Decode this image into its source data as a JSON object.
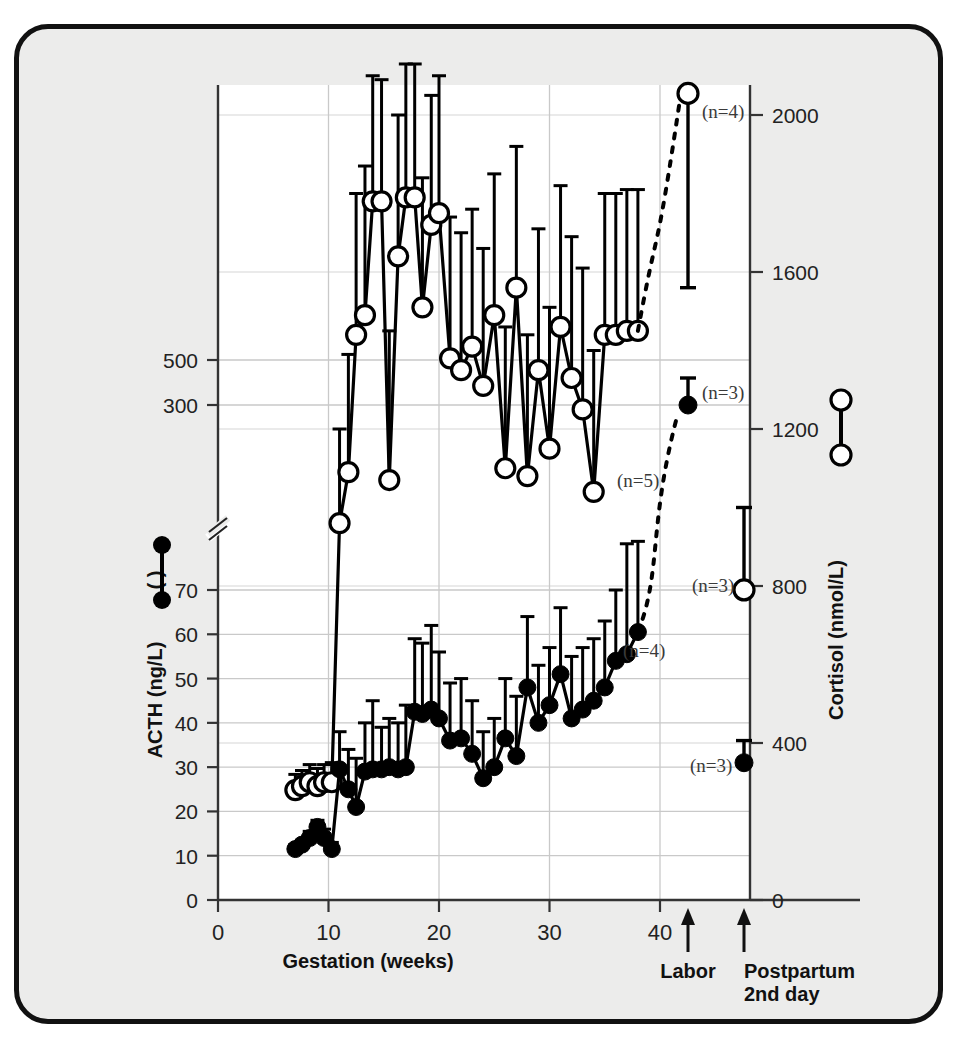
{
  "figure": {
    "background_color": "#ececeb",
    "plot_background_color": "#ffffff",
    "border_color": "#111111",
    "series_color": "#000000"
  },
  "chart_data": {
    "type": "line",
    "title": "",
    "subtitle": "",
    "xlabel": "Gestation (weeks)",
    "ylabel": "ACTH (ng/L)",
    "y2label": "Cortisol (nmol/L)",
    "xlim": [
      0,
      50
    ],
    "xticks": [
      0,
      10,
      20,
      30,
      40
    ],
    "xtick_labels": [
      "0",
      "10",
      "20",
      "30",
      "40"
    ],
    "ylim": [
      0,
      560
    ],
    "yticks": [
      0,
      10,
      20,
      30,
      40,
      50,
      60,
      70,
      300,
      500
    ],
    "ytick_labels": [
      "0",
      "10",
      "20",
      "30",
      "40",
      "50",
      "60",
      "70",
      "300",
      "500"
    ],
    "y_axis_break": true,
    "y_break_after": 70,
    "y2lim": [
      0,
      2200
    ],
    "y2ticks": [
      0,
      400,
      800,
      1200,
      1600,
      2000
    ],
    "y2tick_labels": [
      "0",
      "400",
      "800",
      "1200",
      "1600",
      "2000"
    ],
    "grid": true,
    "legend_position": "axis-labels",
    "series": [
      {
        "name": "ACTH",
        "marker": "filled-circle",
        "axis": "left",
        "units": "ng/L",
        "x": [
          7,
          7.6,
          8.3,
          9,
          9.6,
          10.3,
          11,
          11.8,
          12.5,
          13.3,
          14,
          14.8,
          15.5,
          16.3,
          17,
          17.8,
          18.5,
          19.3,
          20,
          21,
          22,
          23,
          24,
          25,
          26,
          27,
          28,
          29,
          30,
          31,
          32,
          33,
          34,
          35,
          36,
          37,
          38
        ],
        "values": [
          11.5,
          12.5,
          14,
          16.5,
          14,
          11.5,
          29.5,
          25,
          21,
          29,
          29.5,
          29.5,
          30,
          29.5,
          30,
          42.5,
          42,
          43,
          41,
          36,
          36.5,
          33,
          27.5,
          30,
          36.5,
          32.5,
          48,
          40,
          44,
          51,
          41,
          43,
          45,
          48,
          54,
          55.5,
          60.5
        ],
        "errors_upper": [
          12.5,
          13.5,
          15.5,
          18,
          16,
          13,
          38,
          34,
          32,
          40,
          45,
          39,
          41,
          40,
          44,
          59,
          58,
          62,
          56,
          49,
          50,
          45,
          38,
          41,
          50,
          46,
          64,
          53,
          57,
          66,
          55,
          57,
          59,
          63,
          70,
          72,
          76
        ]
      },
      {
        "name": "Cortisol",
        "marker": "open-circle",
        "axis": "right",
        "units": "nmol/L",
        "x": [
          7,
          7.6,
          8.3,
          9,
          9.6,
          10.3,
          11,
          11.8,
          12.5,
          13.3,
          14,
          14.8,
          15.5,
          16.3,
          17,
          17.8,
          18.5,
          19.3,
          20,
          21,
          22,
          23,
          24,
          25,
          26,
          27,
          28,
          29,
          30,
          31,
          32,
          33,
          34,
          35,
          36,
          37,
          38
        ],
        "values": [
          280,
          290,
          300,
          290,
          300,
          300,
          960,
          1090,
          1440,
          1490,
          1780,
          1780,
          1070,
          1640,
          1790,
          1790,
          1510,
          1720,
          1750,
          1380,
          1350,
          1410,
          1310,
          1490,
          1100,
          1560,
          1080,
          1350,
          1150,
          1460,
          1330,
          1250,
          1040,
          1440,
          1440,
          1450,
          1450
        ],
        "errors_upper": [
          320,
          330,
          345,
          335,
          345,
          350,
          1200,
          1390,
          1800,
          1870,
          2100,
          2090,
          1450,
          2000,
          2130,
          2130,
          1840,
          2050,
          2100,
          1740,
          1700,
          1760,
          1660,
          1850,
          1460,
          1920,
          1440,
          1710,
          1510,
          1820,
          1690,
          1610,
          1400,
          1800,
          1800,
          1810,
          1810
        ]
      }
    ],
    "event_points": [
      {
        "event": "Labor",
        "series": "Cortisol",
        "marker": "open-circle",
        "value": 2055,
        "error_lower": 1560,
        "annotation": "(n=4)"
      },
      {
        "event": "Labor",
        "series": "ACTH",
        "marker": "filled-circle",
        "value": 300,
        "error_upper": 420,
        "annotation": "(n=3)"
      },
      {
        "event": "Postpartum 2nd day",
        "series": "Cortisol",
        "marker": "open-circle",
        "value": 790,
        "error_upper": 1000,
        "annotation": "(n=3)"
      },
      {
        "event": "Postpartum 2nd day",
        "series": "ACTH",
        "marker": "filled-circle",
        "value": 31,
        "error_upper": 36,
        "annotation": "(n=3)"
      }
    ],
    "inline_annotations": [
      {
        "text": "(n=5)",
        "near": "Cortisol week 37"
      },
      {
        "text": "(n=4)",
        "near": "ACTH week 38"
      }
    ],
    "event_labels": [
      {
        "label": "Labor",
        "marker": "up-arrow"
      },
      {
        "label": "Postpartum",
        "label2": "2nd day",
        "marker": "up-arrow"
      }
    ]
  },
  "axes": {
    "left_title": "ACTH (ng/L)",
    "left_legend_symbol": "( )",
    "right_title": "Cortisol (nmol/L)",
    "bottom_title": "Gestation (weeks)"
  },
  "events": {
    "labor": "Labor",
    "postpartum_line1": "Postpartum",
    "postpartum_line2": "2nd day"
  },
  "annotations": {
    "labor_cortisol": "(n=4)",
    "labor_acth": "(n=3)",
    "postpartum_cortisol": "(n=3)",
    "postpartum_acth": "(n=3)",
    "inline_cortisol": "(n=5)",
    "inline_acth": "(n=4)"
  }
}
